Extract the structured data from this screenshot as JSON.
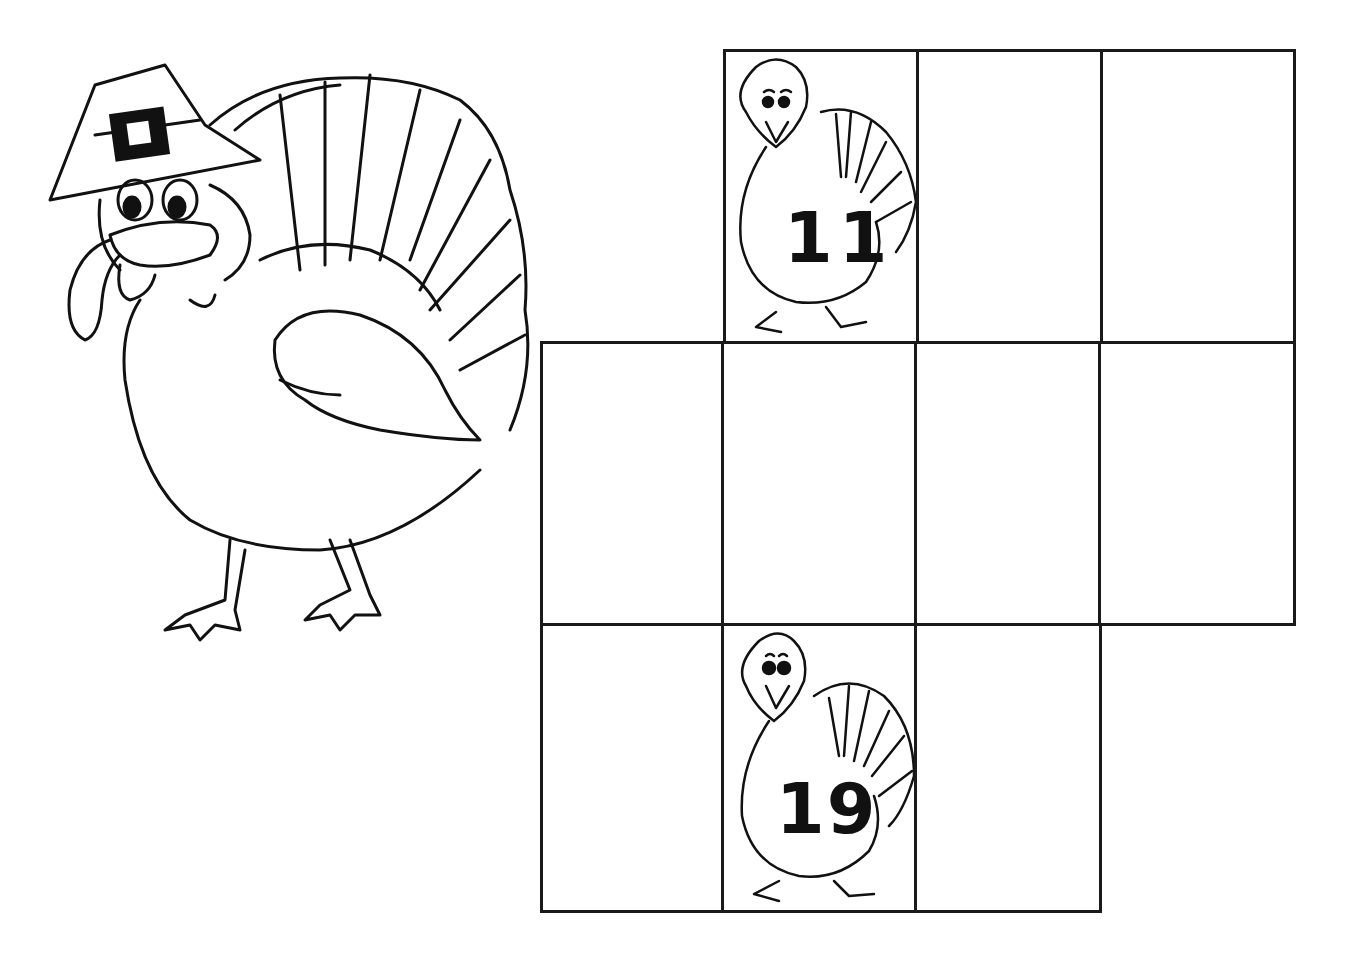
{
  "worksheet": {
    "theme": "Thanksgiving turkey number grid",
    "grid": {
      "rows": [
        {
          "row": 1,
          "cells": [
            {
              "col": 2,
              "value": "11",
              "has_turkey": true
            },
            {
              "col": 3,
              "value": ""
            },
            {
              "col": 4,
              "value": ""
            }
          ]
        },
        {
          "row": 2,
          "cells": [
            {
              "col": 1,
              "value": ""
            },
            {
              "col": 2,
              "value": ""
            },
            {
              "col": 3,
              "value": ""
            },
            {
              "col": 4,
              "value": ""
            }
          ]
        },
        {
          "row": 3,
          "cells": [
            {
              "col": 1,
              "value": ""
            },
            {
              "col": 2,
              "value": "19",
              "has_turkey": true
            },
            {
              "col": 3,
              "value": ""
            }
          ]
        }
      ]
    },
    "illustration": "pilgrim-turkey",
    "colors": {
      "line": "#1a1a1a",
      "background": "#ffffff"
    }
  }
}
